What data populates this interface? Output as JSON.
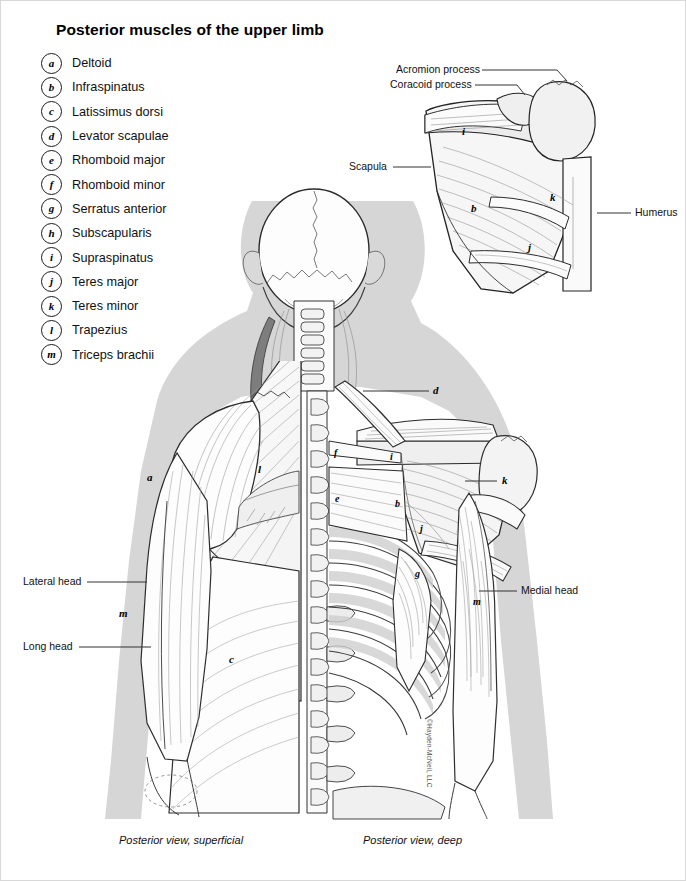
{
  "title": "Posterior muscles of the upper limb",
  "legend": {
    "items": [
      {
        "key": "a",
        "label": "Deltoid"
      },
      {
        "key": "b",
        "label": "Infraspinatus"
      },
      {
        "key": "c",
        "label": "Latissimus dorsi"
      },
      {
        "key": "d",
        "label": "Levator scapulae"
      },
      {
        "key": "e",
        "label": "Rhomboid major"
      },
      {
        "key": "f",
        "label": "Rhomboid minor"
      },
      {
        "key": "g",
        "label": "Serratus anterior"
      },
      {
        "key": "h",
        "label": "Subscapularis"
      },
      {
        "key": "i",
        "label": "Supraspinatus"
      },
      {
        "key": "j",
        "label": "Teres major"
      },
      {
        "key": "k",
        "label": "Teres minor"
      },
      {
        "key": "l",
        "label": "Trapezius"
      },
      {
        "key": "m",
        "label": "Triceps brachii"
      }
    ]
  },
  "inset": {
    "labels": {
      "acromion": "Acromion process",
      "coracoid": "Coracoid process",
      "scapula": "Scapula",
      "humerus": "Humerus"
    },
    "markers": [
      {
        "key": "i",
        "x": 461,
        "y": 131
      },
      {
        "key": "b",
        "x": 470,
        "y": 208
      },
      {
        "key": "k",
        "x": 549,
        "y": 197
      },
      {
        "key": "j",
        "x": 527,
        "y": 247
      }
    ]
  },
  "main": {
    "labels": {
      "lateral_head": "Lateral head",
      "long_head": "Long head",
      "medial_head": "Medial head"
    },
    "markers": [
      {
        "key": "a",
        "x": 146,
        "y": 476
      },
      {
        "key": "l",
        "x": 257,
        "y": 468
      },
      {
        "key": "m",
        "x": 118,
        "y": 612
      },
      {
        "key": "c",
        "x": 228,
        "y": 658
      },
      {
        "key": "d",
        "x": 435,
        "y": 390
      },
      {
        "key": "f",
        "x": 334,
        "y": 452
      },
      {
        "key": "i",
        "x": 390,
        "y": 456
      },
      {
        "key": "e",
        "x": 335,
        "y": 498
      },
      {
        "key": "b",
        "x": 395,
        "y": 503
      },
      {
        "key": "k",
        "x": 503,
        "y": 480
      },
      {
        "key": "j",
        "x": 420,
        "y": 528
      },
      {
        "key": "g",
        "x": 415,
        "y": 573
      },
      {
        "key": "m",
        "x": 473,
        "y": 601
      }
    ]
  },
  "captions": {
    "left": "Posterior view, superficial",
    "right": "Posterior view, deep"
  },
  "credit": "©Hayden-McNeil, LLC",
  "colors": {
    "ink": "#1a1a1a",
    "body_fill": "#ffffff",
    "shadow": "#d3d3d3",
    "bone": "#efefef",
    "muscle": "#fbfbfb"
  }
}
